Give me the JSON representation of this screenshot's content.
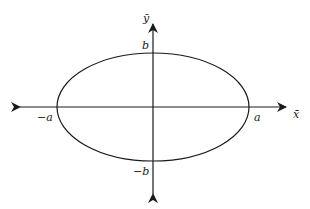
{
  "diagram": {
    "type": "ellipse-on-axes",
    "colors": {
      "stroke": "#1a1a1a",
      "background": "#ffffff"
    },
    "axes": {
      "x_label": "x̄",
      "y_label": "ȳ"
    },
    "ellipse": {
      "center": [
        153,
        107
      ],
      "rx": 96,
      "ry": 54
    },
    "labels": {
      "pos_a": "a",
      "neg_a": "−a",
      "pos_b": "b",
      "neg_b": "−b"
    }
  }
}
